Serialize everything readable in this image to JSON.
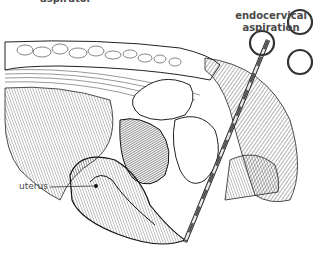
{
  "figure": {
    "colors": {
      "ink": "#1a1a1a",
      "label": "#4a4a4a",
      "background": "#ffffff"
    }
  },
  "labels": {
    "top_clipped": "aspirator",
    "endocervical_line1": "endocervical",
    "endocervical_line2": "aspiration",
    "uterus": "uterus"
  }
}
